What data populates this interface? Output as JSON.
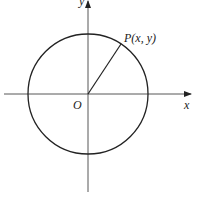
{
  "diagram": {
    "labels": {
      "point": "P(x, y)",
      "origin": "O",
      "x_axis": "x",
      "y_axis": "y"
    },
    "geometry": {
      "center": [
        88,
        94
      ],
      "radius": 60,
      "point_P": [
        121,
        44
      ]
    },
    "colors": {
      "stroke": "#222222",
      "axis": "#444444",
      "background": "#ffffff"
    }
  }
}
